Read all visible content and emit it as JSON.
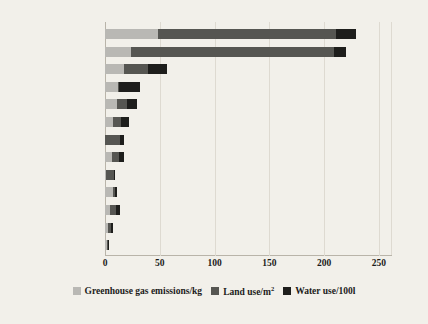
{
  "chart_data": {
    "type": "bar",
    "orientation": "horizontal",
    "stacked": true,
    "title": "",
    "xlabel": "",
    "ylabel": "",
    "xlim": [
      0,
      262
    ],
    "xticks": [
      0,
      50,
      100,
      150,
      200,
      250
    ],
    "xtick_labels": [
      "0",
      "50",
      "100",
      "150",
      "200",
      "250"
    ],
    "grid": true,
    "legend_position": "bottom",
    "categories": [
      "Beef (beef herd)",
      "Lamb",
      "Beef (dairy herd)",
      "Prawn (farmed)",
      "Cheese ‡",
      "Pig meat",
      "Nuts ‡",
      "Poultry",
      "Pulses",
      "Stem-cell meat †",
      "Eggs ‡",
      "Tofu (soybeans)",
      "Insects †"
    ],
    "series": [
      {
        "name": "Greenhouse gas emissions/kg",
        "color": "#b9b8b4",
        "values": [
          48,
          24,
          17,
          12,
          11,
          7,
          0.4,
          6,
          0.8,
          7,
          4.5,
          3,
          1.5
        ]
      },
      {
        "name": "Land use/m²",
        "color": "#565652",
        "values": [
          163,
          185,
          22,
          0.5,
          9,
          8,
          13,
          7,
          7.5,
          2,
          6,
          2.5,
          1
        ]
      },
      {
        "name": "Water use/100l",
        "color": "#1e1e1c",
        "values": [
          18,
          11,
          18,
          19,
          9,
          7,
          4,
          4,
          0.5,
          2,
          3,
          2,
          0.5
        ]
      }
    ],
    "totals": [
      229,
      220,
      57,
      31.5,
      29,
      22,
      17.4,
      17,
      8.8,
      11,
      13.5,
      7.5,
      3
    ]
  },
  "legend": {
    "items": [
      {
        "label_main": "Greenhouse gas emissions/kg",
        "sup": "",
        "icon": "legend-swatch-ghg"
      },
      {
        "label_main": "Land use/m",
        "sup": "2",
        "icon": "legend-swatch-land"
      },
      {
        "label_main": "Water use/100l",
        "sup": "",
        "icon": "legend-swatch-water"
      }
    ]
  }
}
